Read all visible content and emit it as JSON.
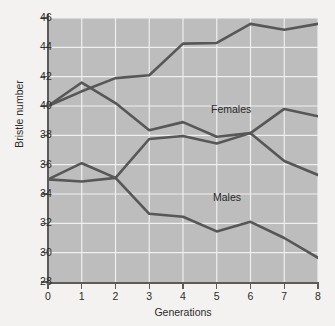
{
  "chart_data": {
    "type": "line",
    "title": "",
    "xlabel": "Generations",
    "ylabel": "Bristle number",
    "x": [
      0,
      1,
      2,
      3,
      4,
      5,
      6,
      7,
      8
    ],
    "xlim": [
      0,
      8
    ],
    "ylim": [
      28,
      46
    ],
    "xticks": [
      "0",
      "1",
      "2",
      "3",
      "4",
      "5",
      "6",
      "7",
      "8"
    ],
    "yticks": [
      "28",
      "30",
      "32",
      "34",
      "36",
      "38",
      "40",
      "42",
      "44",
      "46"
    ],
    "grid": true,
    "grid_color": "#efefef",
    "plot_background": "#bdbdbd",
    "line_color": "#575757",
    "legend_position": "inline-annotations",
    "annotations": [
      {
        "text": "Females",
        "x": 3.9,
        "y": 41.0
      },
      {
        "text": "Males",
        "x": 3.95,
        "y": 35.2
      }
    ],
    "series": [
      {
        "name": "Females high-selected",
        "group": "Females",
        "values": [
          40.0,
          41.0,
          41.9,
          42.1,
          44.25,
          44.3,
          45.6,
          45.2,
          45.6
        ]
      },
      {
        "name": "Females low-selected",
        "group": "Females",
        "values": [
          40.0,
          41.6,
          40.2,
          38.35,
          38.9,
          37.9,
          38.15,
          36.25,
          35.3
        ]
      },
      {
        "name": "Males high-selected",
        "group": "Males",
        "values": [
          35.0,
          34.85,
          35.1,
          37.75,
          37.95,
          37.45,
          38.15,
          39.8,
          39.3
        ]
      },
      {
        "name": "Males low-selected",
        "group": "Males",
        "values": [
          35.0,
          36.1,
          35.1,
          32.65,
          32.45,
          31.45,
          32.1,
          31.0,
          29.65
        ]
      }
    ]
  }
}
